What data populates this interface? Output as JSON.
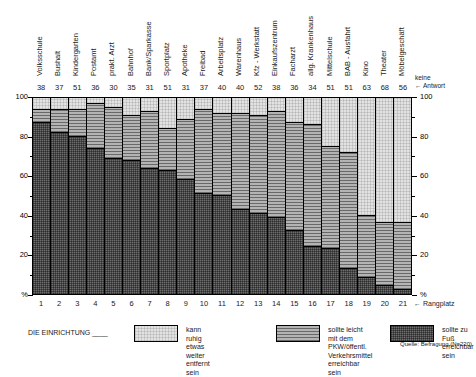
{
  "chart_data": {
    "type": "bar",
    "subtype": "stacked-percentage-bar",
    "title": "",
    "subtitle": "",
    "xlabel": "Rangplatz",
    "ylabel": "%",
    "ylim": [
      0,
      100
    ],
    "y_ticks": [
      "%",
      "20",
      "40",
      "60",
      "80",
      "100"
    ],
    "y_minor_ticks": [
      10,
      30,
      50,
      70,
      90
    ],
    "grid": false,
    "legend_position": "bottom",
    "axis_right_mirrored": true,
    "categories": [
      "Volksschule",
      "Bushalt",
      "Kindergarten",
      "Postamt",
      "prakt. Arzt",
      "Bahnhof",
      "Bank/Sparkasse",
      "Sportplatz",
      "Apotheke",
      "Freibad",
      "Arbeitsplatz",
      "Warenhaus",
      "Kfz - Werkstatt",
      "Einkaufszentrum",
      "Facharzt",
      "allg. Krankenhaus",
      "Mittelschule",
      "BAB - Ausfahrt",
      "Kino",
      "Theater",
      "Möbelgeschäft"
    ],
    "ranks": [
      1,
      2,
      3,
      4,
      5,
      6,
      7,
      8,
      9,
      10,
      11,
      12,
      13,
      14,
      15,
      16,
      17,
      18,
      19,
      20,
      21
    ],
    "no_answer_values": [
      38,
      37,
      51,
      36,
      30,
      35,
      31,
      51,
      31,
      37,
      40,
      40,
      52,
      38,
      36,
      34,
      51,
      51,
      63,
      68,
      56
    ],
    "no_answer_label": "keine Antwort",
    "rank_label": "Rangplatz",
    "series": [
      {
        "name": "sollte zu Fuß erreichbar sein",
        "key": "foot",
        "color": "#6d6d6d",
        "pattern": "dark-checker",
        "values": [
          87,
          82,
          80,
          74,
          69,
          68,
          64,
          63,
          58,
          51,
          50,
          43,
          41,
          39,
          32,
          24,
          23,
          13,
          8,
          4,
          2
        ]
      },
      {
        "name": "sollte leicht mit dem PKW/öffentl. Verkehrsmittel erreichbar sein",
        "key": "car",
        "color": "#b4b4b4",
        "pattern": "horizontal-lines",
        "values": [
          7,
          12,
          14,
          23,
          26,
          23,
          29,
          21,
          31,
          43,
          42,
          49,
          50,
          54,
          55,
          62,
          52,
          59,
          32,
          32,
          34
        ]
      },
      {
        "name": "kann ruhig etwas weiter entfernt sein",
        "key": "far",
        "color": "#e2e2e2",
        "pattern": "light-dots",
        "values": [
          6,
          6,
          6,
          3,
          5,
          9,
          7,
          16,
          11,
          6,
          8,
          8,
          9,
          7,
          13,
          14,
          25,
          28,
          60,
          64,
          64
        ]
      }
    ],
    "source": "Quelle: Befragung (N=220)",
    "legend_prefix": "DIE EINRICHTUNG ____"
  },
  "legend": {
    "prefix": "DIE EINRICHTUNG ____",
    "items": [
      {
        "label": "kann ruhig etwas\nweiter entfernt sein",
        "key": "far"
      },
      {
        "label": "sollte leicht mit dem PKW/öffentl.\nVerkehrsmittel erreichbar sein",
        "key": "car"
      },
      {
        "label": "sollte zu Fuß\nerreichbar sein",
        "key": "foot"
      }
    ]
  },
  "annotations": {
    "keine_antwort_line1": "keine",
    "keine_antwort_line2": "← Antwort",
    "rangplatz": "← Rangplatz",
    "source": "Quelle: Befragung (N=220)"
  }
}
